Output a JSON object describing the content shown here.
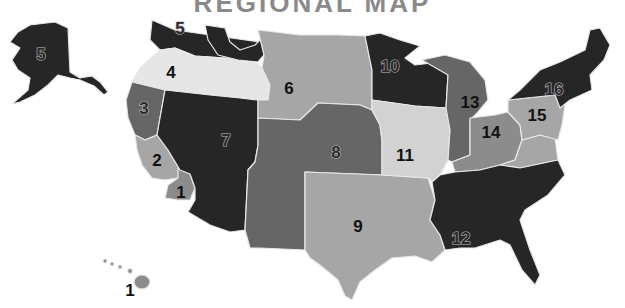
{
  "title": "REGIONAL MAP",
  "colors": {
    "darkest": "#262626",
    "dark": "#4a4a4a",
    "medium_dark": "#666666",
    "medium": "#8c8c8c",
    "medium_light": "#a6a6a6",
    "light": "#d2d2d2",
    "lightest": "#e6e6e6",
    "border": "#e8e8e8"
  },
  "regions": [
    {
      "id": 1,
      "label": "1",
      "area": "Southern California / Hawaii"
    },
    {
      "id": 2,
      "label": "2",
      "area": "Central California"
    },
    {
      "id": 3,
      "label": "3",
      "area": "Northern California"
    },
    {
      "id": 4,
      "label": "4",
      "area": "Oregon / Idaho"
    },
    {
      "id": 5,
      "label": "5",
      "area": "Washington / Alaska"
    },
    {
      "id": 6,
      "label": "6",
      "area": "Montana / Wyoming / Dakotas"
    },
    {
      "id": 7,
      "label": "7",
      "area": "Nevada / Utah / Arizona"
    },
    {
      "id": 8,
      "label": "8",
      "area": "Colorado / Nebraska / Kansas / New Mexico"
    },
    {
      "id": 9,
      "label": "9",
      "area": "Texas / Oklahoma / Arkansas / Louisiana"
    },
    {
      "id": 10,
      "label": "10",
      "area": "Minnesota / Wisconsin"
    },
    {
      "id": 11,
      "label": "11",
      "area": "Iowa / Missouri / Illinois"
    },
    {
      "id": 12,
      "label": "12",
      "area": "Southeast"
    },
    {
      "id": 13,
      "label": "13",
      "area": "Michigan / Indiana"
    },
    {
      "id": 14,
      "label": "14",
      "area": "Ohio / Kentucky / West Virginia"
    },
    {
      "id": 15,
      "label": "15",
      "area": "Pennsylvania / Mid-Atlantic"
    },
    {
      "id": 16,
      "label": "16",
      "area": "New York / New England"
    }
  ]
}
